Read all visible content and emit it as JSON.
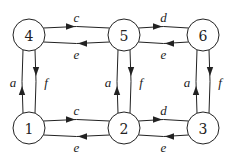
{
  "diagram": {
    "type": "state-transition-graph",
    "nodes": [
      {
        "id": "1",
        "label": "1"
      },
      {
        "id": "2",
        "label": "2"
      },
      {
        "id": "3",
        "label": "3"
      },
      {
        "id": "4",
        "label": "4"
      },
      {
        "id": "5",
        "label": "5"
      },
      {
        "id": "6",
        "label": "6"
      }
    ],
    "edges": [
      {
        "from": "4",
        "to": "5",
        "label": "c"
      },
      {
        "from": "5",
        "to": "4",
        "label": "e"
      },
      {
        "from": "5",
        "to": "6",
        "label": "d"
      },
      {
        "from": "6",
        "to": "5",
        "label": "e"
      },
      {
        "from": "1",
        "to": "2",
        "label": "c"
      },
      {
        "from": "2",
        "to": "1",
        "label": "e"
      },
      {
        "from": "2",
        "to": "3",
        "label": "d"
      },
      {
        "from": "3",
        "to": "2",
        "label": "e"
      },
      {
        "from": "1",
        "to": "4",
        "label": "a"
      },
      {
        "from": "4",
        "to": "1",
        "label": "f"
      },
      {
        "from": "2",
        "to": "5",
        "label": "a"
      },
      {
        "from": "5",
        "to": "2",
        "label": "f"
      },
      {
        "from": "3",
        "to": "6",
        "label": "a"
      },
      {
        "from": "6",
        "to": "3",
        "label": "f"
      }
    ]
  }
}
